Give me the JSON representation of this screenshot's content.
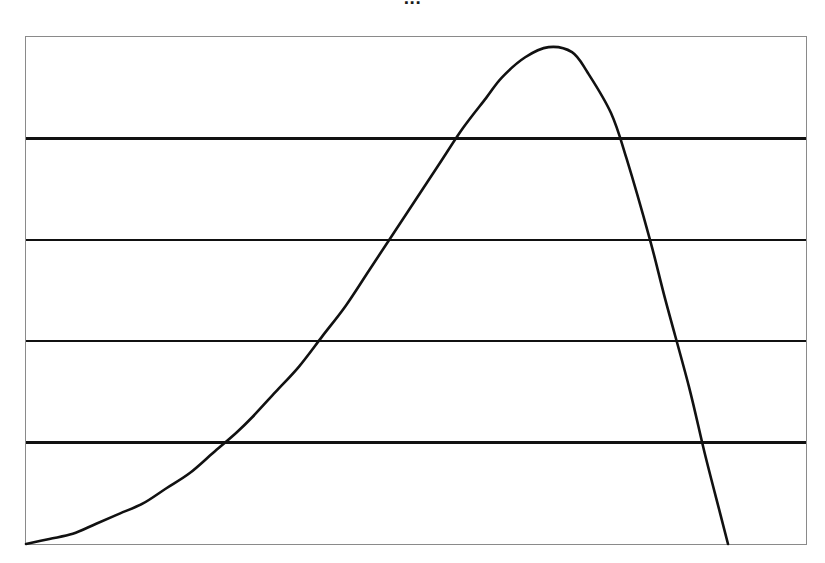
{
  "chart": {
    "title": "...",
    "title_note": "bold title clipped by top edge of screenshot; only lower sliver of glyphs rendered",
    "background_color": "#ffffff",
    "frame_color": "#8a8a8a",
    "curve_color": "#111111",
    "gridline_color": "#111111"
  },
  "chart_data": {
    "type": "line",
    "title": "...",
    "xlabel": "",
    "ylabel": "",
    "grid": true,
    "grid_axis": "y",
    "legend": false,
    "legend_position": "none",
    "axis_ticks_visible": false,
    "tick_labels": [],
    "xlim": [
      0,
      100
    ],
    "ylim": [
      0,
      100
    ],
    "gridline_y_values": [
      80,
      60,
      40,
      20
    ],
    "annotations": [],
    "series": [
      {
        "name": "density",
        "description": "right-skewed unimodal density curve rising from the origin to a rounded peak then falling steeply",
        "x": [
          0,
          3,
          6,
          9,
          12,
          15,
          18,
          21,
          24,
          27,
          29,
          32,
          35,
          38,
          41,
          44,
          47,
          50,
          53,
          56,
          59,
          61,
          64,
          67,
          70,
          72,
          75,
          77,
          80,
          82,
          85,
          87,
          89,
          90
        ],
        "y": [
          0,
          1,
          2,
          4,
          6,
          8,
          11,
          14,
          18,
          22,
          25,
          30,
          35,
          41,
          47,
          54,
          61,
          68,
          75,
          82,
          88,
          92,
          96,
          98,
          97,
          93,
          85,
          76,
          60,
          48,
          31,
          18,
          6,
          0
        ]
      }
    ],
    "key_points": {
      "start": {
        "x": 0,
        "y": 0
      },
      "peak": {
        "x": 66.5,
        "y": 98
      },
      "end": {
        "x": 90,
        "y": 0
      }
    }
  }
}
